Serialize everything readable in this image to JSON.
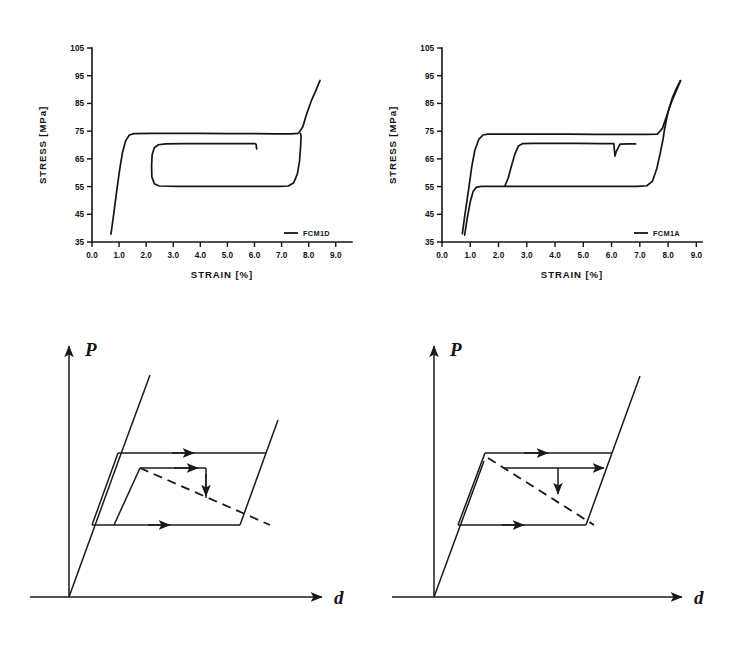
{
  "figure": {
    "background_color": "#ffffff",
    "ink_color": "#151515"
  },
  "chart_data": [
    {
      "panel_id": "chart-left",
      "type": "line",
      "title": "",
      "xlabel": "STRAIN [%]",
      "ylabel": "STRESS [MPa]",
      "xlim": [
        0.0,
        9.6
      ],
      "ylim": [
        35,
        105
      ],
      "xticks": [
        "0.0",
        "1.0",
        "2.0",
        "3.0",
        "4.0",
        "5.0",
        "6.0",
        "7.0",
        "8.0",
        "9.0"
      ],
      "xtick_values": [
        0.0,
        1.0,
        2.0,
        3.0,
        4.0,
        5.0,
        6.0,
        7.0,
        8.0,
        9.0
      ],
      "yticks": [
        "105",
        "95",
        "85",
        "75",
        "65",
        "55",
        "45",
        "35"
      ],
      "ytick_values": [
        105,
        95,
        85,
        75,
        65,
        55,
        45,
        35
      ],
      "grid": false,
      "legend_position": "bottom-right-inside",
      "series": [
        {
          "name": "FCM1D",
          "label": "FCM1D",
          "style": "solid",
          "points": [
            [
              0.7,
              37.8
            ],
            [
              0.8,
              45.0
            ],
            [
              0.92,
              54.0
            ],
            [
              1.02,
              61.0
            ],
            [
              1.12,
              67.0
            ],
            [
              1.24,
              71.5
            ],
            [
              1.38,
              73.6
            ],
            [
              1.55,
              74.1
            ],
            [
              2.2,
              74.2
            ],
            [
              3.0,
              74.2
            ],
            [
              4.0,
              74.2
            ],
            [
              5.0,
              74.1
            ],
            [
              6.0,
              74.1
            ],
            [
              6.8,
              74.0
            ],
            [
              7.35,
              74.0
            ],
            [
              7.62,
              74.2
            ],
            [
              7.78,
              76.5
            ],
            [
              7.92,
              81.0
            ],
            [
              8.1,
              86.0
            ],
            [
              8.28,
              90.0
            ],
            [
              8.42,
              93.3
            ]
          ]
        },
        {
          "name": "FCM1D-inner-loop",
          "label": "",
          "style": "solid",
          "points": [
            [
              6.08,
              68.6
            ],
            [
              6.06,
              70.2
            ],
            [
              6.02,
              70.5
            ],
            [
              5.4,
              70.5
            ],
            [
              4.4,
              70.5
            ],
            [
              3.4,
              70.5
            ],
            [
              2.72,
              70.4
            ],
            [
              2.45,
              70.1
            ],
            [
              2.3,
              69.0
            ],
            [
              2.22,
              66.5
            ],
            [
              2.2,
              62.5
            ],
            [
              2.21,
              58.5
            ],
            [
              2.3,
              56.0
            ],
            [
              2.48,
              55.2
            ],
            [
              3.2,
              55.1
            ],
            [
              4.2,
              55.1
            ],
            [
              5.2,
              55.1
            ],
            [
              6.2,
              55.1
            ],
            [
              6.9,
              55.1
            ],
            [
              7.25,
              55.2
            ],
            [
              7.45,
              56.4
            ],
            [
              7.58,
              59.5
            ],
            [
              7.66,
              64.0
            ],
            [
              7.7,
              69.0
            ],
            [
              7.72,
              73.0
            ],
            [
              7.7,
              74.2
            ]
          ]
        }
      ]
    },
    {
      "panel_id": "chart-right",
      "type": "line",
      "title": "",
      "xlabel": "STRAIN [%]",
      "ylabel": "STRESS [MPa]",
      "xlim": [
        0.0,
        9.2
      ],
      "ylim": [
        35,
        105
      ],
      "xticks": [
        "0.0",
        "1.0",
        "2.0",
        "3.0",
        "4.0",
        "5.0",
        "6.0",
        "7.0",
        "8.0",
        "9.0"
      ],
      "xtick_values": [
        0.0,
        1.0,
        2.0,
        3.0,
        4.0,
        5.0,
        6.0,
        7.0,
        8.0,
        9.0
      ],
      "yticks": [
        "105",
        "95",
        "85",
        "75",
        "65",
        "55",
        "45",
        "35"
      ],
      "ytick_values": [
        105,
        95,
        85,
        75,
        65,
        55,
        45,
        35
      ],
      "grid": false,
      "legend_position": "bottom-right-inside",
      "series": [
        {
          "name": "FCM1A",
          "label": "FCM1A",
          "style": "solid",
          "points": [
            [
              0.72,
              38.0
            ],
            [
              0.82,
              45.5
            ],
            [
              0.95,
              54.5
            ],
            [
              1.05,
              62.0
            ],
            [
              1.16,
              68.0
            ],
            [
              1.3,
              72.0
            ],
            [
              1.45,
              73.6
            ],
            [
              1.62,
              73.9
            ],
            [
              2.4,
              73.9
            ],
            [
              3.4,
              73.9
            ],
            [
              4.4,
              73.9
            ],
            [
              5.4,
              73.8
            ],
            [
              6.4,
              73.8
            ],
            [
              7.2,
              73.8
            ],
            [
              7.62,
              73.9
            ],
            [
              7.8,
              76.0
            ],
            [
              7.95,
              80.5
            ],
            [
              8.12,
              85.5
            ],
            [
              8.3,
              89.8
            ],
            [
              8.44,
              93.2
            ]
          ]
        },
        {
          "name": "FCM1A-lower-branch",
          "label": "",
          "style": "solid",
          "points": [
            [
              0.8,
              37.5
            ],
            [
              0.9,
              44.0
            ],
            [
              1.0,
              49.5
            ],
            [
              1.1,
              53.2
            ],
            [
              1.22,
              54.8
            ],
            [
              1.4,
              55.1
            ],
            [
              2.1,
              55.1
            ],
            [
              3.1,
              55.1
            ],
            [
              4.1,
              55.1
            ],
            [
              5.1,
              55.1
            ],
            [
              6.1,
              55.1
            ],
            [
              6.9,
              55.1
            ],
            [
              7.25,
              55.3
            ],
            [
              7.45,
              57.0
            ],
            [
              7.6,
              61.5
            ],
            [
              7.72,
              67.0
            ],
            [
              7.82,
              72.0
            ],
            [
              7.88,
              76.0
            ],
            [
              8.0,
              82.0
            ],
            [
              8.15,
              87.0
            ],
            [
              8.3,
              90.5
            ],
            [
              8.44,
              93.2
            ]
          ]
        },
        {
          "name": "FCM1A-inner-loop",
          "label": "",
          "style": "solid",
          "points": [
            [
              2.22,
              55.1
            ],
            [
              2.34,
              58.0
            ],
            [
              2.46,
              62.5
            ],
            [
              2.58,
              66.8
            ],
            [
              2.7,
              69.6
            ],
            [
              2.86,
              70.5
            ],
            [
              3.2,
              70.6
            ],
            [
              4.0,
              70.6
            ],
            [
              4.8,
              70.6
            ],
            [
              5.6,
              70.5
            ],
            [
              6.08,
              70.5
            ],
            [
              6.1,
              68.2
            ],
            [
              6.12,
              66.0
            ],
            [
              6.16,
              67.5
            ],
            [
              6.3,
              70.3
            ],
            [
              6.6,
              70.4
            ],
            [
              6.85,
              70.4
            ]
          ]
        }
      ]
    }
  ],
  "diagrams": [
    {
      "panel_id": "diagram-left",
      "y_axis_label": "P",
      "x_axis_label": "d",
      "description": "load-displacement hysteresis loop with inner sub-loop and dashed diagonal",
      "arrow_count": 5
    },
    {
      "panel_id": "diagram-right",
      "y_axis_label": "P",
      "x_axis_label": "d",
      "description": "load-displacement hysteresis loop with horizontal inner arrow and dashed diagonal",
      "arrow_count": 5
    }
  ]
}
